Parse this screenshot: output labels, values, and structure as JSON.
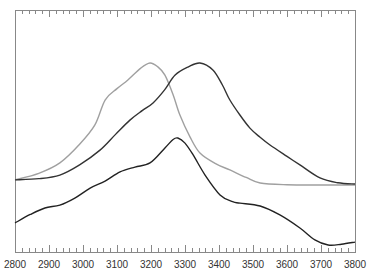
{
  "chart_data": {
    "type": "line",
    "title": "",
    "xlabel": "",
    "ylabel": "",
    "xlim": [
      2800,
      3800
    ],
    "ylim": [
      0,
      100
    ],
    "grid": false,
    "legend": null,
    "x_ticks": [
      2800,
      2900,
      3000,
      3100,
      3200,
      3300,
      3400,
      3500,
      3600,
      3700,
      3800
    ],
    "x_tick_labels": [
      "2800",
      "2900",
      "3000",
      "3100",
      "3200",
      "3300",
      "3400",
      "3500",
      "3600",
      "3700",
      "3800"
    ],
    "x_minor_tick_step": 20,
    "y_ticks_visible": false,
    "series": [
      {
        "name": "gray-curve",
        "color": "#a0a0a0",
        "points": [
          [
            2800,
            29.8
          ],
          [
            2870,
            32.5
          ],
          [
            2932,
            36.8
          ],
          [
            2990,
            44.5
          ],
          [
            3035,
            52.5
          ],
          [
            3065,
            62.8
          ],
          [
            3100,
            67.5
          ],
          [
            3132,
            71.1
          ],
          [
            3170,
            76.0
          ],
          [
            3197,
            78.1
          ],
          [
            3220,
            76.5
          ],
          [
            3241,
            73.1
          ],
          [
            3265,
            65.0
          ],
          [
            3285,
            56.6
          ],
          [
            3315,
            47.5
          ],
          [
            3344,
            40.9
          ],
          [
            3390,
            36.5
          ],
          [
            3432,
            33.9
          ],
          [
            3480,
            30.8
          ],
          [
            3521,
            28.5
          ],
          [
            3600,
            27.8
          ],
          [
            3697,
            27.7
          ],
          [
            3800,
            27.7
          ]
        ]
      },
      {
        "name": "dark-upper-curve",
        "color": "#333333",
        "points": [
          [
            2800,
            29.8
          ],
          [
            2870,
            30.3
          ],
          [
            2932,
            31.8
          ],
          [
            2990,
            36.0
          ],
          [
            3050,
            42.1
          ],
          [
            3095,
            48.5
          ],
          [
            3138,
            54.5
          ],
          [
            3175,
            58.5
          ],
          [
            3206,
            61.6
          ],
          [
            3240,
            67.0
          ],
          [
            3271,
            73.1
          ],
          [
            3310,
            76.5
          ],
          [
            3344,
            78.1
          ],
          [
            3382,
            75.2
          ],
          [
            3410,
            69.0
          ],
          [
            3432,
            62.8
          ],
          [
            3462,
            56.5
          ],
          [
            3491,
            51.2
          ],
          [
            3520,
            47.5
          ],
          [
            3550,
            44.2
          ],
          [
            3600,
            39.5
          ],
          [
            3638,
            36.0
          ],
          [
            3697,
            30.6
          ],
          [
            3750,
            28.6
          ],
          [
            3800,
            28.1
          ]
        ]
      },
      {
        "name": "dark-lower-curve",
        "color": "#222222",
        "points": [
          [
            2800,
            12.0
          ],
          [
            2845,
            15.5
          ],
          [
            2888,
            18.2
          ],
          [
            2932,
            19.4
          ],
          [
            2976,
            22.3
          ],
          [
            3021,
            26.4
          ],
          [
            3065,
            29.3
          ],
          [
            3109,
            33.1
          ],
          [
            3153,
            35.1
          ],
          [
            3197,
            36.8
          ],
          [
            3241,
            43.0
          ],
          [
            3265,
            46.5
          ],
          [
            3279,
            47.1
          ],
          [
            3300,
            45.0
          ],
          [
            3324,
            40.1
          ],
          [
            3359,
            31.8
          ],
          [
            3403,
            23.6
          ],
          [
            3440,
            20.8
          ],
          [
            3462,
            20.2
          ],
          [
            3521,
            19.0
          ],
          [
            3579,
            15.3
          ],
          [
            3638,
            9.9
          ],
          [
            3682,
            5.0
          ],
          [
            3721,
            2.9
          ],
          [
            3760,
            3.2
          ],
          [
            3800,
            4.1
          ]
        ]
      }
    ]
  },
  "frame": {
    "color": "#888888",
    "left": 15,
    "top": 10,
    "right": 355,
    "bottom": 252
  }
}
